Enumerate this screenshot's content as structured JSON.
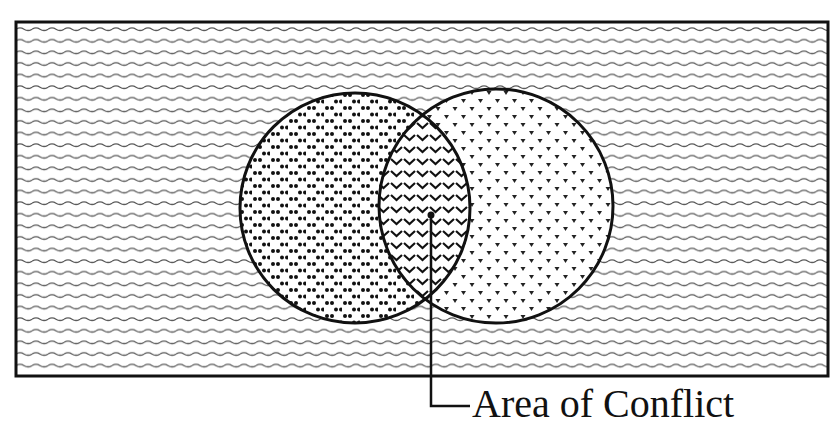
{
  "diagram": {
    "type": "venn",
    "background_region": {
      "pattern": "wavy-lines"
    },
    "circles": [
      {
        "id": "left",
        "cx": 355,
        "cy": 208,
        "r": 115,
        "pattern": "double-dots"
      },
      {
        "id": "right",
        "cx": 496,
        "cy": 206,
        "r": 117,
        "pattern": "triangles"
      }
    ],
    "overlap_pattern": "chevrons",
    "callout": {
      "label": "Area of Conflict",
      "pointer_x": 430,
      "pointer_top_y": 180
    },
    "colors": {
      "ink": "#111111",
      "paper": "#ffffff",
      "wave": "#555555"
    }
  }
}
